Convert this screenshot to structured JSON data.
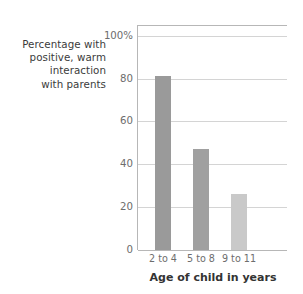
{
  "chart_data": {
    "type": "bar",
    "title": "",
    "subtitle": "",
    "categories": [
      "2 to 4",
      "5 to 8",
      "9 to 11"
    ],
    "values": [
      81,
      47,
      26
    ],
    "xlabel": "Age of child in years",
    "ylabel": "Percentage with positive, warm interaction with parents",
    "ylabel_lines": [
      "Percentage with",
      "positive, warm",
      "interaction",
      "with parents"
    ],
    "ylim": [
      0,
      105
    ],
    "yticks": [
      0,
      20,
      40,
      60,
      80,
      100
    ],
    "ytick_labels": [
      "0",
      "20",
      "40",
      "60",
      "80",
      "100%"
    ],
    "grid": true,
    "legend": false,
    "legend_position": "none",
    "bar_colors": [
      "#9a9a9a",
      "#a0a0a0",
      "#c9c9c9"
    ],
    "series": [
      {
        "name": "Percentage with positive, warm interaction with parents",
        "values": [
          81,
          47,
          26
        ]
      }
    ]
  },
  "colors": {
    "bar_dark": "#9a9a9a",
    "bar_mid": "#a0a0a0",
    "bar_light": "#c9c9c9",
    "gridline": "#d4d4d4",
    "axis": "#b7b7b7",
    "tick_text": "#6d6d6d",
    "label_text": "#3b3b3b",
    "title_text": "#333333",
    "background": "#ffffff"
  }
}
